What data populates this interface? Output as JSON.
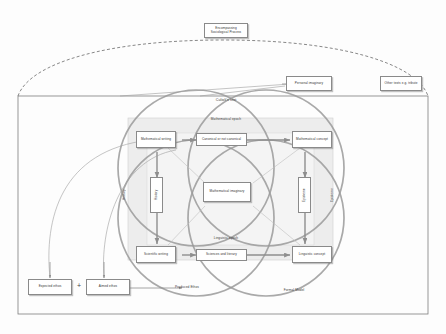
{
  "diagram": {
    "title_label": "Culioli's text",
    "outer": {
      "encompassing": "Encompassing Sociological Process",
      "personal_imaginary": "Personal imaginary",
      "other_texts": "Other texts e.g. tribute"
    },
    "epochs": {
      "top": "Mathematical epoch",
      "bottom": "Linguistic epoch"
    },
    "axes": {
      "left": "History",
      "right": "Episteme"
    },
    "corners": {
      "top_left": "Mathematical writing",
      "top_right": "Mathematical concept",
      "bottom_left": "Scientific writing",
      "bottom_right": "Linguistic concept"
    },
    "mid_nodes": {
      "top": "Canonical or not canonical",
      "bottom": "Sciences and literary",
      "left": "History",
      "right": "Episteme"
    },
    "center": "Mathematical imaginary",
    "ethos": {
      "expected": "Expected ethos",
      "operator": "+",
      "aimed": "Aimed ethos",
      "result": "Produced Ethos"
    },
    "formal_model": "Formal Model",
    "colors": {
      "circle_stroke": "#9a9a9a",
      "node_stroke": "#8a8a8a",
      "connector": "#8e8e8e",
      "panel_fill": "#eeeeee"
    }
  }
}
